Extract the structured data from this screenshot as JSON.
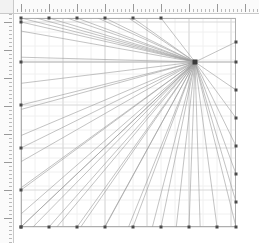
{
  "app": {
    "title": "Perspective Grid Canvas",
    "background_color": "#ffffff",
    "width": 259,
    "height": 243
  },
  "rulers": {
    "top": {
      "name": "horizontal-ruler",
      "orientation": "horizontal",
      "x": 0,
      "y": 0,
      "length": 259,
      "thickness": 13,
      "background_color": "#fbfbfb",
      "tick_color": "#8d8d8d",
      "border_color": "#c9c9c9",
      "minor_tick_spacing": 4,
      "major_tick_spacing": 28,
      "origin_px": 21,
      "labels": [
        "0",
        "1",
        "2",
        "3",
        "4",
        "5",
        "6",
        "7"
      ]
    },
    "left": {
      "name": "vertical-ruler",
      "orientation": "vertical",
      "x": 0,
      "y": 0,
      "length": 243,
      "thickness": 13,
      "background_color": "#fbfbfb",
      "tick_color": "#8d8d8d",
      "border_color": "#c9c9c9",
      "minor_tick_spacing": 4,
      "major_tick_spacing": 28,
      "origin_px": 22,
      "labels": [
        "0",
        "1",
        "2",
        "3",
        "4",
        "5",
        "6",
        "7"
      ]
    },
    "corner": {
      "name": "ruler-corner",
      "background_color": "#f2f2f2"
    }
  },
  "canvas": {
    "name": "drawing-canvas",
    "left": 21,
    "top": 18,
    "right": 236,
    "bottom": 227,
    "fill": "#ffffff",
    "border_color": "#aeaeae"
  },
  "grid": {
    "name": "background-grid",
    "visible": true,
    "minor_color": "#f0f0f0",
    "major_color": "#d8d8d8",
    "minor_spacing": 14,
    "major_spacing": 42,
    "x_lines": [
      21,
      35,
      49,
      63,
      77,
      91,
      105,
      119,
      133,
      147,
      161,
      175,
      189,
      203,
      217,
      231,
      236
    ],
    "y_lines": [
      18,
      32,
      46,
      62,
      76,
      90,
      105,
      119,
      133,
      148,
      162,
      176,
      190,
      204,
      218,
      227
    ],
    "major_x": [
      21,
      63,
      105,
      147,
      189,
      231
    ],
    "major_y": [
      22,
      62,
      105,
      148,
      190,
      227
    ]
  },
  "vanishing_point": {
    "name": "vanishing-point",
    "x": 195,
    "y": 62,
    "marker_color": "#3a3a3a",
    "marker_size": 5,
    "label": "VP"
  },
  "rays": {
    "name": "perspective-ray-bundle",
    "stroke_color": "#9a9a9a",
    "stroke_width": 0.6,
    "count": 40,
    "description": "Radial fan of straight lines converging at the vanishing point, each terminating at an anchor node on the canvas border."
  },
  "anchors": {
    "name": "edge-anchor-nodes",
    "color": "#4a4a4a",
    "size": 3,
    "left_edge_y": [
      22,
      62,
      105,
      148,
      190,
      227
    ],
    "bottom_edge_x": [
      21,
      49,
      77,
      105,
      133,
      161,
      189,
      217
    ],
    "top_edge_x": [
      21,
      49,
      77,
      105,
      133,
      161
    ],
    "right_edge_y": [
      42,
      62,
      90,
      118,
      146,
      174,
      202,
      227
    ]
  }
}
